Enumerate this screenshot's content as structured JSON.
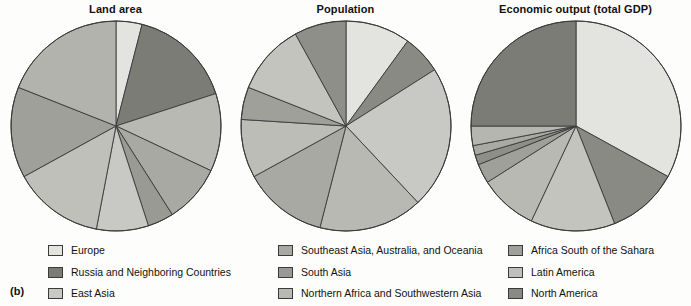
{
  "figure": {
    "panel_letter": "(b)"
  },
  "colors": {
    "very_light": "#e3e3e0",
    "light": "#c8c8c4",
    "mid_light": "#b9b9b4",
    "mid": "#a9a9a4",
    "mid_dark": "#9a9a95",
    "dark": "#8a8a85",
    "darker": "#7c7c77",
    "outline": "#3a3a3a",
    "background": "#fdfdfb"
  },
  "legend": {
    "rows": [
      {
        "label": "Europe",
        "color": "#e3e3e0"
      },
      {
        "label": "Russia and Neighboring Countries",
        "color": "#7c7c77"
      },
      {
        "label": "East Asia",
        "color": "#c8c8c4"
      },
      {
        "label": "Southeast Asia, Australia, and Oceania",
        "color": "#a9a9a4"
      },
      {
        "label": "South Asia",
        "color": "#9a9a95"
      },
      {
        "label": "Northern Africa and Southwestern Asia",
        "color": "#b9b9b4"
      },
      {
        "label": "Africa South of the Sahara",
        "color": "#a0a09b"
      },
      {
        "label": "Latin America",
        "color": "#c0c0bb"
      },
      {
        "label": "North America",
        "color": "#8a8a85"
      }
    ]
  },
  "chart_data": [
    {
      "type": "pie",
      "title": "Land area",
      "start_angle_deg": 0,
      "direction": "clockwise",
      "radius_px": 105,
      "labels": [
        "Europe",
        "Russia and Neighboring Countries",
        "Northern Africa and Southwestern Asia",
        "Southeast Asia, Australia, and Oceania",
        "South Asia",
        "East Asia",
        "Latin America",
        "North America",
        "Africa South of the Sahara"
      ],
      "values": [
        4,
        16,
        12,
        9,
        4,
        8,
        14,
        14,
        19
      ],
      "colors": [
        "#e3e3e0",
        "#7c7c77",
        "#b9b9b4",
        "#a9a9a4",
        "#9a9a95",
        "#c8c8c4",
        "#c0c0bb",
        "#a0a09b",
        "#b3b3ae"
      ]
    },
    {
      "type": "pie",
      "title": "Population",
      "start_angle_deg": 0,
      "direction": "clockwise",
      "radius_px": 105,
      "labels": [
        "East Asia",
        "South Asia",
        "Southeast Asia, Australia, and Oceania",
        "Northern Africa and Southwestern Asia",
        "Africa South of the Sahara",
        "Latin America",
        "North America",
        "Europe",
        "Russia and Neighboring Countries"
      ],
      "values": [
        10,
        6,
        22,
        16,
        13,
        9,
        5,
        11,
        8
      ],
      "colors": [
        "#e3e3e0",
        "#8a8a85",
        "#c8c8c4",
        "#b9b9b4",
        "#a9a9a4",
        "#bdbdb8",
        "#a0a09b",
        "#c4c4bf",
        "#8f8f8a"
      ]
    },
    {
      "type": "pie",
      "title": "Economic output (total GDP)",
      "start_angle_deg": 0,
      "direction": "clockwise",
      "radius_px": 105,
      "labels": [
        "Europe",
        "North America",
        "East Asia",
        "Latin America",
        "Southeast Asia, Australia, and Oceania",
        "South Asia",
        "Africa South of the Sahara",
        "Northern Africa and Southwestern Asia",
        "Russia and Neighboring Countries"
      ],
      "values": [
        33,
        11,
        13,
        9,
        3,
        1.5,
        1.5,
        3,
        25
      ],
      "colors": [
        "#e3e3e0",
        "#8a8a85",
        "#c4c4bf",
        "#b9b9b4",
        "#a0a09b",
        "#8f8f8a",
        "#aaaaa5",
        "#b6b6b1",
        "#7c7c77"
      ]
    }
  ]
}
